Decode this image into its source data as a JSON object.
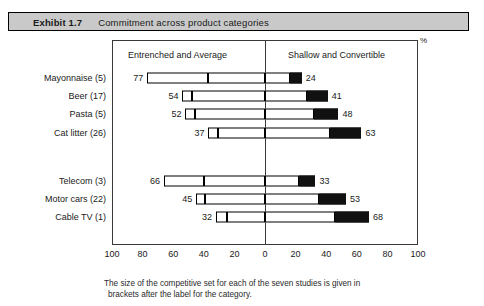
{
  "exhibit": {
    "number": "Exhibit 1.7",
    "title": "Commitment across product categories"
  },
  "axis_unit_label": "%",
  "footnote": {
    "line1": "The size of the competitive set for each of the seven studies is given in",
    "line2": "brackets after the label for the category."
  },
  "chart_data": {
    "type": "bar",
    "orientation": "horizontal",
    "style": "diverging-bidirectional",
    "title": "Commitment across product categories",
    "xlabel": "%",
    "ylabel": "",
    "xlim": [
      -100,
      100
    ],
    "grid": false,
    "legend_position": "top-inside",
    "column_captions": [
      "Entrenched and Average",
      "Shallow and Convertible"
    ],
    "xticks": [
      "100",
      "80",
      "60",
      "40",
      "20",
      "0",
      "20",
      "40",
      "60",
      "80",
      "100"
    ],
    "xtick_values": [
      -100,
      -80,
      -60,
      -40,
      -20,
      0,
      20,
      40,
      60,
      80,
      100
    ],
    "categories": [
      "Mayonnaise (5)",
      "Beer (17)",
      "Pasta (5)",
      "Cat litter (26)",
      "Telecom (3)",
      "Motor cars (22)",
      "Cable TV (1)"
    ],
    "series": [
      {
        "name": "Entrenched and Average",
        "side": "left",
        "color": "#ffffff",
        "values": [
          77,
          54,
          52,
          37,
          66,
          45,
          32
        ]
      },
      {
        "name": "Shallow and Convertible",
        "side": "right",
        "color": "#111111",
        "values": [
          24,
          41,
          48,
          63,
          33,
          53,
          68
        ]
      }
    ],
    "left_segment_splits": [
      37,
      48,
      46,
      31,
      40,
      39,
      25
    ],
    "rows": [
      {
        "category": "Mayonnaise (5)",
        "left": 77,
        "right": 24,
        "split": 37,
        "group": 1
      },
      {
        "category": "Beer (17)",
        "left": 54,
        "right": 41,
        "split": 48,
        "group": 1
      },
      {
        "category": "Pasta (5)",
        "left": 52,
        "right": 48,
        "split": 46,
        "group": 1
      },
      {
        "category": "Cat litter (26)",
        "left": 37,
        "right": 63,
        "split": 31,
        "group": 1
      },
      {
        "category": "Telecom (3)",
        "left": 66,
        "right": 33,
        "split": 40,
        "group": 2
      },
      {
        "category": "Motor cars (22)",
        "left": 45,
        "right": 53,
        "split": 39,
        "group": 2
      },
      {
        "category": "Cable TV (1)",
        "left": 32,
        "right": 68,
        "split": 25,
        "group": 2
      }
    ]
  }
}
